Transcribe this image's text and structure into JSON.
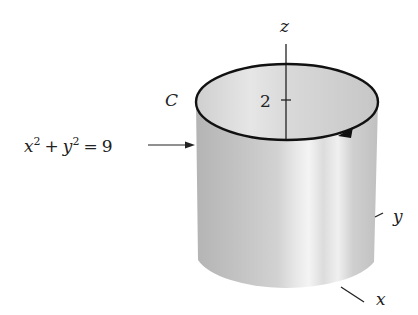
{
  "figure": {
    "axis_labels": {
      "z": "z",
      "y": "y",
      "x": "x"
    },
    "z_tick": "2",
    "curve_label": "C",
    "surface_equation": {
      "x": "x",
      "x_exp": "2",
      "plus": "+",
      "y": "y",
      "y_exp": "2",
      "eq": "=",
      "rhs": "9"
    },
    "colors": {
      "surface_dark": "#b8b8b8",
      "surface_light": "#ececec",
      "curve": "#111111",
      "axis": "#222222"
    }
  }
}
